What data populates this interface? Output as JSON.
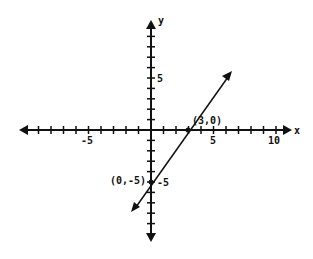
{
  "chart_data": {
    "type": "line",
    "title": "",
    "xlabel": "x",
    "ylabel": "y",
    "xlim": [
      -10,
      11
    ],
    "ylim": [
      -9,
      9
    ],
    "grid": false,
    "x_tick_labels": [
      "-5",
      "5",
      "10"
    ],
    "y_tick_labels": [
      "5",
      "-5"
    ],
    "series": [
      {
        "name": "line",
        "x": [
          -1.5,
          6.4
        ],
        "y": [
          -7.5,
          5.6
        ],
        "arrows": "both"
      }
    ],
    "points": [
      {
        "x": 3,
        "y": 0,
        "label": "(3,0)"
      },
      {
        "x": 0,
        "y": -5,
        "label": "(0,-5)"
      }
    ]
  },
  "labels": {
    "x_axis": "x",
    "y_axis": "y",
    "tick_neg5": "-5",
    "tick_5": "5",
    "tick_10": "10",
    "ytick_5": "5",
    "ytick_neg5": "-5",
    "point_a": "(3,0)",
    "point_b": "(0,-5)"
  },
  "colors": {
    "ink": "#111111",
    "background": "#ffffff"
  }
}
